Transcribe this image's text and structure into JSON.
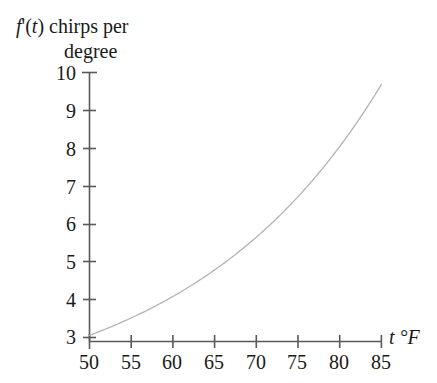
{
  "chart_data": {
    "type": "line",
    "title": "",
    "ylabel": "f'(t) chirps per degree",
    "ylabel_line1": "f'(t) chirps per",
    "ylabel_line2": "degree",
    "ylabel_fprime": "f",
    "ylabel_prime_t": "'(",
    "ylabel_t": "t",
    "ylabel_rest": ") chirps per",
    "xlabel": "t °F",
    "xlabel_var": "t",
    "xlabel_unit": "°F",
    "x": [
      50,
      55,
      60,
      65,
      70,
      75,
      80,
      85
    ],
    "y": [
      2.1,
      2.9,
      3.4,
      4.1,
      4.9,
      6.0,
      7.8,
      10.1
    ],
    "xticks": [
      50,
      55,
      60,
      65,
      70,
      75,
      80,
      85
    ],
    "xtick_labels": [
      "50",
      "55",
      "60",
      "65",
      "70",
      "75",
      "80",
      "85"
    ],
    "yticks": [
      2,
      3,
      4,
      5,
      6,
      7,
      8,
      9,
      10
    ],
    "ytick_labels": [
      "",
      "3",
      "4",
      "5",
      "6",
      "7",
      "8",
      "9",
      "10"
    ],
    "xlim": [
      50,
      85
    ],
    "ylim": [
      2,
      10.3
    ],
    "grid": false,
    "legend": false,
    "curve_color": "#b3b3b3",
    "axis_color": "#595959",
    "text_color": "#1a1a1a",
    "background_color": "#ffffff",
    "annotations": []
  }
}
